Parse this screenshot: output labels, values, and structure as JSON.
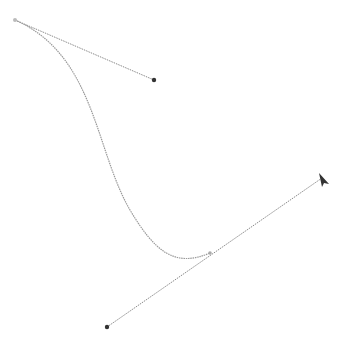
{
  "canvas": {
    "background": "#ffffff",
    "stroke_color": "#8a8a8a",
    "handle_color": "#333333"
  },
  "bezier": {
    "start_anchor": {
      "x": 15,
      "y": 20
    },
    "start_handle": {
      "x": 154,
      "y": 80
    },
    "end_anchor": {
      "x": 210,
      "y": 253
    },
    "end_handle_in": {
      "x": 107,
      "y": 327
    },
    "end_handle_out": {
      "x": 322,
      "y": 178
    }
  },
  "cursor": {
    "icon": "arrow-cursor-icon",
    "x": 319,
    "y": 174
  }
}
